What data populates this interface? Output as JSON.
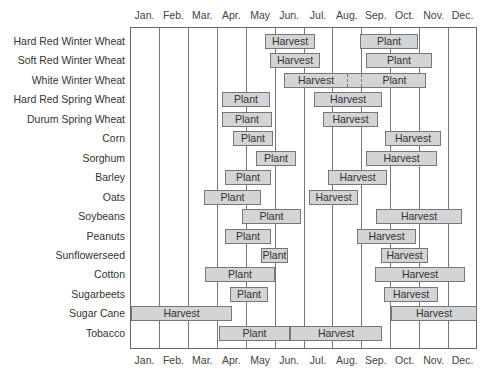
{
  "chart_data": {
    "type": "gantt",
    "title": "",
    "xlabel": "",
    "ylabel": "",
    "months": [
      "Jan.",
      "Feb.",
      "Mar.",
      "Apr.",
      "May",
      "Jun.",
      "Jul.",
      "Aug.",
      "Sep.",
      "Oct.",
      "Nov.",
      "Dec."
    ],
    "grid": true,
    "bar_color": "#d2d4d6",
    "crops": [
      {
        "name": "Hard Red Winter Wheat",
        "bars": [
          {
            "label": "Harvest",
            "start": "late May",
            "end": "mid Jun.",
            "x0": 265,
            "x1": 315
          },
          {
            "label": "Plant",
            "start": "early Sep.",
            "end": "early Nov.",
            "x0": 360,
            "x1": 418
          }
        ]
      },
      {
        "name": "Soft Red Winter Wheat",
        "bars": [
          {
            "label": "Harvest",
            "start": "late May",
            "end": "late Jun.",
            "x0": 270,
            "x1": 320
          },
          {
            "label": "Plant",
            "start": "mid Sep.",
            "end": "mid Nov.",
            "x0": 366,
            "x1": 432
          }
        ]
      },
      {
        "name": "White Winter Wheat",
        "bars": [
          {
            "label": "Harvest",
            "start": "mid Jun.",
            "end": "late Aug.",
            "x0": 284,
            "x1": 346
          },
          {
            "label": "Plant",
            "start": "early Sep.",
            "end": "mid Nov.",
            "x0": 361,
            "x1": 426
          }
        ],
        "dashed_overlap": [
          346,
          360
        ]
      },
      {
        "name": "Hard Red Spring Wheat",
        "bars": [
          {
            "label": "Plant",
            "start": "early Apr.",
            "end": "late May",
            "x0": 222,
            "x1": 270
          },
          {
            "label": "Harvest",
            "start": "mid Jul.",
            "end": "mid Sep.",
            "x0": 314,
            "x1": 382
          }
        ]
      },
      {
        "name": "Durum Spring Wheat",
        "bars": [
          {
            "label": "Plant",
            "start": "early Apr.",
            "end": "late May",
            "x0": 222,
            "x1": 272
          },
          {
            "label": "Harvest",
            "start": "mid Jul.",
            "end": "mid Sep.",
            "x0": 323,
            "x1": 378
          }
        ]
      },
      {
        "name": "Corn",
        "bars": [
          {
            "label": "Plant",
            "start": "mid Apr.",
            "end": "late May",
            "x0": 233,
            "x1": 273
          },
          {
            "label": "Harvest",
            "start": "late Sep.",
            "end": "late Oct.",
            "x0": 385,
            "x1": 441
          }
        ]
      },
      {
        "name": "Sorghum",
        "bars": [
          {
            "label": "Plant",
            "start": "mid May",
            "end": "early Jun.",
            "x0": 256,
            "x1": 296
          },
          {
            "label": "Harvest",
            "start": "mid Sep.",
            "end": "late Nov.",
            "x0": 366,
            "x1": 437
          }
        ]
      },
      {
        "name": "Barley",
        "bars": [
          {
            "label": "Plant",
            "start": "early Apr.",
            "end": "late May",
            "x0": 225,
            "x1": 271
          },
          {
            "label": "Harvest",
            "start": "late Jul.",
            "end": "mid Sep.",
            "x0": 328,
            "x1": 387
          }
        ]
      },
      {
        "name": "Oats",
        "bars": [
          {
            "label": "Plant",
            "start": "mid Mar.",
            "end": "early May",
            "x0": 204,
            "x1": 261
          },
          {
            "label": "Harvest",
            "start": "early Jul.",
            "end": "late Aug.",
            "x0": 309,
            "x1": 358
          }
        ]
      },
      {
        "name": "Soybeans",
        "bars": [
          {
            "label": "Plant",
            "start": "late Apr.",
            "end": "mid Jun.",
            "x0": 242,
            "x1": 301
          },
          {
            "label": "Harvest",
            "start": "late Sep.",
            "end": "late Nov.",
            "x0": 376,
            "x1": 462
          }
        ]
      },
      {
        "name": "Peanuts",
        "bars": [
          {
            "label": "Plant",
            "start": "early Apr.",
            "end": "late May",
            "x0": 225,
            "x1": 271
          },
          {
            "label": "Harvest",
            "start": "late Aug.",
            "end": "mid Oct.",
            "x0": 357,
            "x1": 416
          }
        ]
      },
      {
        "name": "Sunflowerseed",
        "bars": [
          {
            "label": "Plant",
            "start": "mid May",
            "end": "early Jun.",
            "x0": 261,
            "x1": 288
          },
          {
            "label": "Harvest",
            "start": "late Sep.",
            "end": "late Oct.",
            "x0": 381,
            "x1": 428
          }
        ]
      },
      {
        "name": "Cotton",
        "bars": [
          {
            "label": "Plant",
            "start": "mid Mar.",
            "end": "late May",
            "x0": 205,
            "x1": 275
          },
          {
            "label": "Harvest",
            "start": "mid Sep.",
            "end": "late Nov.",
            "x0": 375,
            "x1": 465
          }
        ]
      },
      {
        "name": "Sugarbeets",
        "bars": [
          {
            "label": "Plant",
            "start": "mid Apr.",
            "end": "mid May",
            "x0": 230,
            "x1": 268
          },
          {
            "label": "Harvest",
            "start": "late Sep.",
            "end": "late Oct.",
            "x0": 384,
            "x1": 438
          }
        ]
      },
      {
        "name": "Sugar Cane",
        "bars": [
          {
            "label": "Harvest",
            "start": "Jan.",
            "end": "mid Mar.",
            "x0": 131,
            "x1": 232
          },
          {
            "label": "Harvest",
            "start": "Oct.",
            "end": "Dec.",
            "x0": 391,
            "x1": 477
          }
        ]
      },
      {
        "name": "Tobacco",
        "bars": [
          {
            "label": "Plant",
            "start": "Apr.",
            "end": "mid Jun.",
            "x0": 219,
            "x1": 290
          },
          {
            "label": "Harvest",
            "start": "mid Jun.",
            "end": "mid Sep.",
            "x0": 290,
            "x1": 382
          }
        ]
      }
    ]
  }
}
